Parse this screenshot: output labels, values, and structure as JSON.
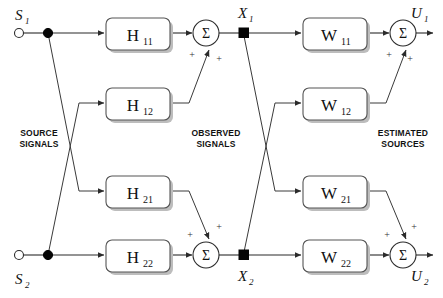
{
  "diagram": {
    "colors": {
      "wire": "#2b2b2b",
      "block_stroke": "#555555",
      "block_fill": "#ffffff",
      "shadow": "#bdbdbd",
      "text": "#111111",
      "background": "#ffffff"
    },
    "sources": [
      {
        "name": "s1",
        "label": "S",
        "subscript": "1"
      },
      {
        "name": "s2",
        "label": "S",
        "subscript": "2"
      }
    ],
    "observed": [
      {
        "name": "x1",
        "label": "X",
        "subscript": "1"
      },
      {
        "name": "x2",
        "label": "X",
        "subscript": "2"
      }
    ],
    "estimated": [
      {
        "name": "u1",
        "label": "U",
        "subscript": "1"
      },
      {
        "name": "u2",
        "label": "U",
        "subscript": "2"
      }
    ],
    "mixing_blocks": [
      {
        "name": "h11",
        "label": "H",
        "subscript": "11"
      },
      {
        "name": "h12",
        "label": "H",
        "subscript": "12"
      },
      {
        "name": "h21",
        "label": "H",
        "subscript": "21"
      },
      {
        "name": "h22",
        "label": "H",
        "subscript": "22"
      }
    ],
    "unmixing_blocks": [
      {
        "name": "w11",
        "label": "W",
        "subscript": "11"
      },
      {
        "name": "w12",
        "label": "W",
        "subscript": "12"
      },
      {
        "name": "w21",
        "label": "W",
        "subscript": "21"
      },
      {
        "name": "w22",
        "label": "W",
        "subscript": "22"
      }
    ],
    "summers": [
      {
        "name": "sum-top-left",
        "glyph": "Σ"
      },
      {
        "name": "sum-bottom-left",
        "glyph": "Σ"
      },
      {
        "name": "sum-top-right",
        "glyph": "Σ"
      },
      {
        "name": "sum-bottom-right",
        "glyph": "Σ"
      }
    ],
    "signs": {
      "plus": "+"
    },
    "section_labels": [
      {
        "name": "source-signals",
        "line1": "SOURCE",
        "line2": "SIGNALS"
      },
      {
        "name": "observed-signals",
        "line1": "OBSERVED",
        "line2": "SIGNALS"
      },
      {
        "name": "estimated-sources",
        "line1": "ESTIMATED",
        "line2": "SOURCES"
      }
    ]
  }
}
